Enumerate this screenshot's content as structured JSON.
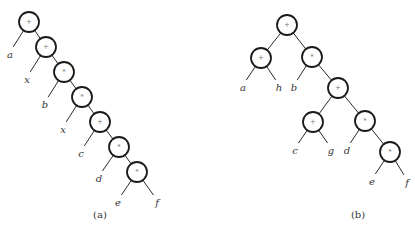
{
  "diagrams": [
    {
      "caption": "(a)",
      "caption_pos": [
        100,
        214
      ],
      "nodes": [
        {
          "id": "a1",
          "label": "+",
          "x": 29,
          "y": 22
        },
        {
          "id": "a2",
          "label": "+",
          "x": 46,
          "y": 47
        },
        {
          "id": "a3",
          "label": "*",
          "x": 64,
          "y": 72
        },
        {
          "id": "a4",
          "label": "*",
          "x": 82,
          "y": 97
        },
        {
          "id": "a5",
          "label": "+",
          "x": 100,
          "y": 122
        },
        {
          "id": "a6",
          "label": "*",
          "x": 119,
          "y": 147
        },
        {
          "id": "a7",
          "label": "*",
          "x": 137,
          "y": 172
        }
      ],
      "leaves": [
        {
          "id": "la",
          "label": "a",
          "x": 10,
          "y": 52,
          "parent": "a1"
        },
        {
          "id": "lx1",
          "label": "x",
          "x": 27,
          "y": 77,
          "parent": "a2"
        },
        {
          "id": "lb",
          "label": "b",
          "x": 45,
          "y": 102,
          "parent": "a3"
        },
        {
          "id": "lx2",
          "label": "x",
          "x": 63,
          "y": 127,
          "parent": "a4"
        },
        {
          "id": "lc",
          "label": "c",
          "x": 81,
          "y": 151,
          "parent": "a5"
        },
        {
          "id": "ld",
          "label": "d",
          "x": 99,
          "y": 176,
          "parent": "a6"
        },
        {
          "id": "le",
          "label": "e",
          "x": 118,
          "y": 200,
          "parent": "a7"
        },
        {
          "id": "lf",
          "label": "f",
          "x": 157,
          "y": 200,
          "parent": "a7"
        }
      ],
      "edges": [
        [
          "a1",
          "a2"
        ],
        [
          "a2",
          "a3"
        ],
        [
          "a3",
          "a4"
        ],
        [
          "a4",
          "a5"
        ],
        [
          "a5",
          "a6"
        ],
        [
          "a6",
          "a7"
        ]
      ]
    },
    {
      "caption": "(b)",
      "caption_pos": [
        358,
        214
      ],
      "nodes": [
        {
          "id": "b1",
          "label": "+",
          "x": 287,
          "y": 25
        },
        {
          "id": "b2",
          "label": "+",
          "x": 261,
          "y": 58
        },
        {
          "id": "b3",
          "label": "*",
          "x": 312,
          "y": 57
        },
        {
          "id": "b4",
          "label": "+",
          "x": 338,
          "y": 88
        },
        {
          "id": "b5",
          "label": "+",
          "x": 313,
          "y": 122
        },
        {
          "id": "b6",
          "label": "*",
          "x": 365,
          "y": 121
        },
        {
          "id": "b7",
          "label": "*",
          "x": 390,
          "y": 152
        }
      ],
      "leaves": [
        {
          "id": "ma",
          "label": "a",
          "x": 243,
          "y": 85,
          "parent": "b2"
        },
        {
          "id": "mh",
          "label": "h",
          "x": 279,
          "y": 85,
          "parent": "b2"
        },
        {
          "id": "mb",
          "label": "b",
          "x": 294,
          "y": 85,
          "parent": "b3"
        },
        {
          "id": "mc",
          "label": "c",
          "x": 295,
          "y": 148,
          "parent": "b5"
        },
        {
          "id": "mg",
          "label": "g",
          "x": 331,
          "y": 148,
          "parent": "b5"
        },
        {
          "id": "md",
          "label": "d",
          "x": 347,
          "y": 148,
          "parent": "b6"
        },
        {
          "id": "me",
          "label": "e",
          "x": 372,
          "y": 179,
          "parent": "b7"
        },
        {
          "id": "mf",
          "label": "f",
          "x": 407,
          "y": 180,
          "parent": "b7"
        }
      ],
      "edges": [
        [
          "b1",
          "b2"
        ],
        [
          "b1",
          "b3"
        ],
        [
          "b3",
          "b4"
        ],
        [
          "b4",
          "b5"
        ],
        [
          "b4",
          "b6"
        ],
        [
          "b6",
          "b7"
        ]
      ]
    }
  ],
  "style": {
    "node_radius": 10,
    "node_stroke": "#1a1a1a",
    "edge_color": "#2a2a2a",
    "background": "#ffffff"
  }
}
